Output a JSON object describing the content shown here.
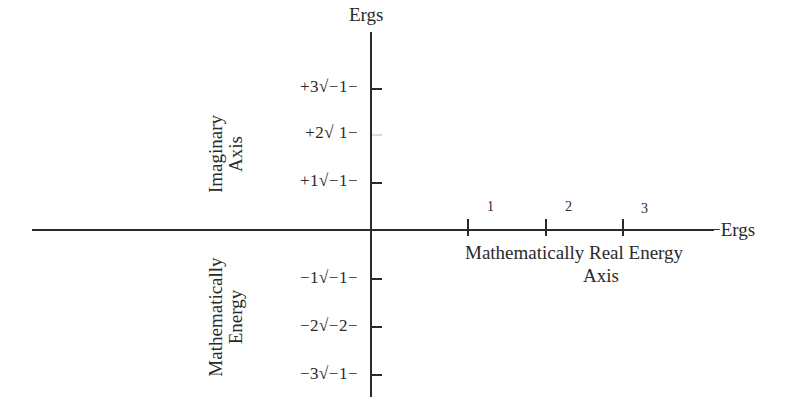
{
  "diagram": {
    "vertical_axis": {
      "end_label": "Ergs",
      "upper_side_label": [
        "Imaginary",
        "Axis"
      ],
      "lower_side_label": [
        "Mathematically",
        "Energy"
      ],
      "ticks": [
        {
          "label": "+3√−1−",
          "value": "+3"
        },
        {
          "label": "+2√ 1−",
          "value": "+2"
        },
        {
          "label": "+1√−1−",
          "value": "+1"
        },
        {
          "label": "−1√−1−",
          "value": "-1"
        },
        {
          "label": "−2√−2−",
          "value": "-2"
        },
        {
          "label": "−3√−1−",
          "value": "-3"
        }
      ]
    },
    "horizontal_axis": {
      "end_label": "−Ergs",
      "caption_line1": "Mathematically Real Energy",
      "caption_line2": "Axis",
      "ticks": [
        {
          "label": "1"
        },
        {
          "label": "2"
        },
        {
          "label": "3"
        }
      ]
    }
  }
}
